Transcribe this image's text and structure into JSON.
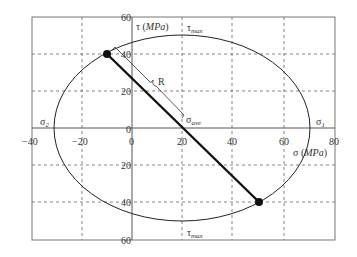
{
  "diagram": {
    "type": "mohr-circle",
    "x_axis": {
      "label_symbol": "σ",
      "label_unit": "MPa",
      "ticks": [
        "−40",
        "−20",
        "0",
        "20",
        "40",
        "60",
        "80"
      ],
      "range": [
        -40,
        80
      ]
    },
    "y_axis": {
      "label_symbol": "τ",
      "label_unit": "MPa",
      "ticks_pos": [
        "60",
        "40",
        "20",
        "0"
      ],
      "ticks_neg": [
        "20",
        "40",
        "60"
      ],
      "range": [
        -60,
        60
      ]
    },
    "labels": {
      "sigma1": "σ",
      "sigma1_sub": "1",
      "sigma2": "σ",
      "sigma2_sub": "2",
      "sigma_ave": "σ",
      "sigma_ave_sub": "ave",
      "tau_max_top": "τ",
      "tau_max_top_sub": "max",
      "tau_max_bottom": "τ",
      "tau_max_bottom_sub": "max",
      "radius": "R",
      "y_title_sym": "τ (",
      "y_title_unit": "MPa",
      "y_title_close": ")",
      "x_title_sym": "σ (",
      "x_title_unit": "MPa",
      "x_title_close": ")"
    },
    "points": [
      {
        "sigma": -10,
        "tau": 40
      },
      {
        "sigma": 50,
        "tau": -40
      }
    ],
    "center": {
      "sigma": 20,
      "tau": 0
    },
    "radius": 50,
    "sigma1_value": 70,
    "sigma2_value": -30
  }
}
